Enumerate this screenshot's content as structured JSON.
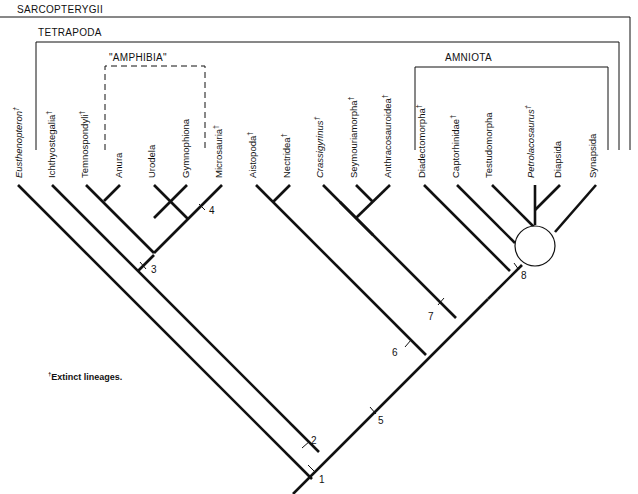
{
  "diagram": {
    "type": "cladogram",
    "groups": {
      "sarcopterygii": "SARCOPTERYGII",
      "tetrapoda": "TETRAPODA",
      "amphibia": "\"AMPHIBIA\"",
      "amniota": "AMNIOTA"
    },
    "taxa": [
      {
        "name": "Eusthenopteron",
        "extinct": true,
        "italic": true
      },
      {
        "name": "Ichthyostegalia",
        "extinct": true,
        "italic": false
      },
      {
        "name": "Temnospondyli",
        "extinct": true,
        "italic": false
      },
      {
        "name": "Anura",
        "extinct": false,
        "italic": false
      },
      {
        "name": "Urodela",
        "extinct": false,
        "italic": false
      },
      {
        "name": "Gymnophiona",
        "extinct": false,
        "italic": false
      },
      {
        "name": "Microsauria",
        "extinct": true,
        "italic": false
      },
      {
        "name": "Aistopoda",
        "extinct": true,
        "italic": false
      },
      {
        "name": "Nectridea",
        "extinct": true,
        "italic": false
      },
      {
        "name": "Crassigyrinus",
        "extinct": true,
        "italic": true
      },
      {
        "name": "Seymouriamorpha",
        "extinct": true,
        "italic": false
      },
      {
        "name": "Anthracosauroidea",
        "extinct": true,
        "italic": false
      },
      {
        "name": "Diadectomorpha",
        "extinct": true,
        "italic": false
      },
      {
        "name": "Captorhinidae",
        "extinct": true,
        "italic": false
      },
      {
        "name": "Testudomorpha",
        "extinct": false,
        "italic": false
      },
      {
        "name": "Petrolacosaurus",
        "extinct": true,
        "italic": true
      },
      {
        "name": "Diapsida",
        "extinct": false,
        "italic": false
      },
      {
        "name": "Synapsida",
        "extinct": false,
        "italic": false
      }
    ],
    "dagger": "†",
    "nodes": [
      "1",
      "2",
      "3",
      "4",
      "5",
      "6",
      "7",
      "8"
    ],
    "footnote": {
      "dagger": "†",
      "text": "Extinct lineages."
    }
  }
}
